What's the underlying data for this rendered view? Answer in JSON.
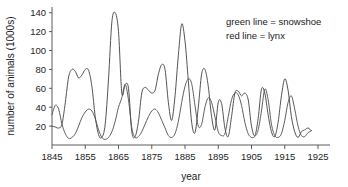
{
  "chart_data": {
    "type": "line",
    "title": "",
    "xlabel": "year",
    "ylabel": "number of animals (1000s)",
    "xlim": [
      1845,
      1925
    ],
    "ylim": [
      0,
      145
    ],
    "xticks": [
      1845,
      1855,
      1865,
      1875,
      1885,
      1895,
      1905,
      1915,
      1925
    ],
    "yticks": [
      20,
      40,
      60,
      80,
      100,
      120,
      140
    ],
    "grid": false,
    "legend_position": "top-right",
    "legend_entries": [
      "green line = snowshoe",
      "red line = lynx"
    ],
    "series": [
      {
        "name": "snowshoe",
        "legend_label": "green line = snowshoe",
        "color": "#4a4a4a",
        "x": [
          1845,
          1846,
          1847,
          1848,
          1849,
          1850,
          1851,
          1852,
          1853,
          1854,
          1855,
          1856,
          1857,
          1858,
          1859,
          1860,
          1861,
          1862,
          1863,
          1864,
          1865,
          1866,
          1867,
          1868,
          1869,
          1870,
          1871,
          1872,
          1873,
          1874,
          1875,
          1876,
          1877,
          1878,
          1879,
          1880,
          1881,
          1882,
          1883,
          1884,
          1885,
          1886,
          1887,
          1888,
          1889,
          1890,
          1891,
          1892,
          1893,
          1894,
          1895,
          1896,
          1897,
          1898,
          1899,
          1900,
          1901,
          1902,
          1903,
          1904,
          1905,
          1906,
          1907,
          1908,
          1909,
          1910,
          1911,
          1912,
          1913,
          1914,
          1915,
          1916,
          1917,
          1918,
          1919,
          1920,
          1921,
          1922,
          1923
        ],
        "y": [
          20,
          19,
          18,
          22,
          45,
          72,
          80,
          78,
          71,
          74,
          80,
          79,
          62,
          30,
          11,
          8,
          22,
          70,
          130,
          140,
          120,
          55,
          64,
          60,
          14,
          9,
          25,
          55,
          61,
          58,
          55,
          58,
          75,
          85,
          80,
          45,
          26,
          52,
          95,
          128,
          110,
          68,
          24,
          13,
          40,
          75,
          80,
          62,
          30,
          16,
          45,
          44,
          18,
          9,
          30,
          55,
          57,
          52,
          55,
          48,
          20,
          10,
          28,
          59,
          55,
          32,
          14,
          9,
          24,
          52,
          70,
          58,
          30,
          14,
          8,
          14,
          16,
          18,
          15
        ]
      },
      {
        "name": "lynx",
        "legend_label": "red line = lynx",
        "color": "#555555",
        "x": [
          1845,
          1846,
          1847,
          1848,
          1849,
          1850,
          1851,
          1852,
          1853,
          1854,
          1855,
          1856,
          1857,
          1858,
          1859,
          1860,
          1861,
          1862,
          1863,
          1864,
          1865,
          1866,
          1867,
          1868,
          1869,
          1870,
          1871,
          1872,
          1873,
          1874,
          1875,
          1876,
          1877,
          1878,
          1879,
          1880,
          1881,
          1882,
          1883,
          1884,
          1885,
          1886,
          1887,
          1888,
          1889,
          1890,
          1891,
          1892,
          1893,
          1894,
          1895,
          1896,
          1897,
          1898,
          1899,
          1900,
          1901,
          1902,
          1903,
          1904,
          1905,
          1906,
          1907,
          1908,
          1909,
          1910,
          1911,
          1912,
          1913,
          1914,
          1915,
          1916,
          1917,
          1918,
          1919,
          1920,
          1921,
          1922,
          1923
        ],
        "y": [
          32,
          42,
          38,
          22,
          12,
          7,
          8,
          12,
          20,
          29,
          35,
          38,
          36,
          28,
          16,
          8,
          6,
          8,
          14,
          25,
          40,
          50,
          64,
          48,
          18,
          8,
          9,
          14,
          22,
          30,
          36,
          38,
          34,
          26,
          18,
          10,
          8,
          12,
          25,
          45,
          62,
          70,
          65,
          42,
          20,
          22,
          40,
          50,
          45,
          30,
          14,
          10,
          12,
          30,
          48,
          55,
          53,
          42,
          24,
          12,
          8,
          9,
          16,
          36,
          59,
          48,
          22,
          10,
          8,
          12,
          26,
          45,
          52,
          38,
          20,
          10,
          9,
          13,
          15
        ]
      }
    ]
  },
  "axis": {
    "y_title": "number of animals (1000s)",
    "x_title": "year",
    "yticks": [
      "140",
      "120",
      "100",
      "80",
      "60",
      "40",
      "20"
    ],
    "xticks": [
      "1845",
      "1855",
      "1865",
      "1875",
      "1885",
      "1895",
      "1905",
      "1915",
      "1925"
    ]
  },
  "legend": {
    "line1": "green line = snowshoe",
    "line2": "red line = lynx"
  }
}
